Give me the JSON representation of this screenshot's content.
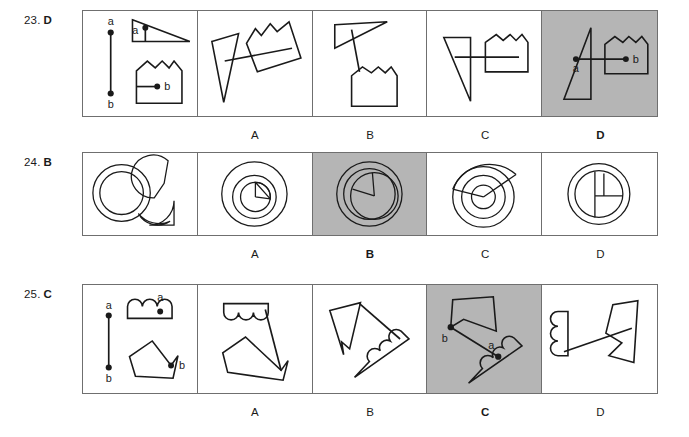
{
  "page": {
    "kind": "answer-key-figure-sheet",
    "background_color": "#ffffff",
    "shaded_color": "#b5b5b5",
    "ink_color": "#1a1a1a",
    "border_color": "#6f6f6f"
  },
  "questions": [
    {
      "number": "23.",
      "answer": "D",
      "stem_point_labels": [
        "a",
        "b"
      ],
      "stem_shape_labels": [
        "a",
        "b"
      ],
      "options": [
        {
          "letter": "A",
          "selected": false
        },
        {
          "letter": "B",
          "selected": false
        },
        {
          "letter": "C",
          "selected": false
        },
        {
          "letter": "D",
          "selected": true,
          "point_labels": [
            "a",
            "b"
          ]
        }
      ]
    },
    {
      "number": "24.",
      "answer": "B",
      "stem_point_labels": [],
      "stem_shape_labels": [],
      "options": [
        {
          "letter": "A",
          "selected": false
        },
        {
          "letter": "B",
          "selected": true
        },
        {
          "letter": "C",
          "selected": false
        },
        {
          "letter": "D",
          "selected": false
        }
      ]
    },
    {
      "number": "25.",
      "answer": "C",
      "stem_point_labels": [
        "a",
        "b"
      ],
      "stem_shape_labels": [
        "a",
        "b"
      ],
      "options": [
        {
          "letter": "A",
          "selected": false
        },
        {
          "letter": "B",
          "selected": false
        },
        {
          "letter": "C",
          "selected": true,
          "point_labels": [
            "b",
            "a"
          ]
        },
        {
          "letter": "D",
          "selected": false
        }
      ]
    }
  ]
}
